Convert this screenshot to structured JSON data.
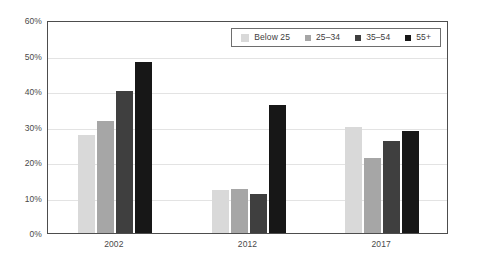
{
  "chart_data": {
    "type": "bar",
    "title": "",
    "subtitle": "",
    "xlabel": "",
    "ylabel": "",
    "categories": [
      "2002",
      "2012",
      "2017"
    ],
    "series": [
      {
        "name": "Below 25",
        "values": [
          27.5,
          12.0,
          30.0
        ],
        "color": "#d9d9d9"
      },
      {
        "name": "25–34",
        "values": [
          31.5,
          12.3,
          21.0
        ],
        "color": "#a6a6a6"
      },
      {
        "name": "35–54",
        "values": [
          40.0,
          11.0,
          26.0
        ],
        "color": "#3f3f3f"
      },
      {
        "name": "55+",
        "values": [
          48.2,
          36.2,
          28.7
        ],
        "color": "#171717"
      }
    ],
    "ylim": [
      0,
      60
    ],
    "ytick_values": [
      0,
      10,
      20,
      30,
      40,
      50,
      60
    ],
    "ytick_labels": [
      "0%",
      "10%",
      "20%",
      "30%",
      "40%",
      "50%",
      "60%"
    ],
    "xtick_labels": [
      "2002",
      "2012",
      "2017"
    ],
    "grid": true,
    "grid_axis": "y",
    "legend": true,
    "legend_position": "top-right",
    "value_suffix": "%"
  },
  "legend": {
    "items": [
      {
        "label": "Below 25",
        "color": "#d9d9d9"
      },
      {
        "label": "25–34",
        "color": "#a6a6a6"
      },
      {
        "label": "35–54",
        "color": "#3f3f3f"
      },
      {
        "label": "55+",
        "color": "#171717"
      }
    ]
  },
  "axes": {
    "y_labels": [
      "60%",
      "50%",
      "40%",
      "30%",
      "20%",
      "10%",
      "0%"
    ],
    "x_labels": [
      "2002",
      "2012",
      "2017"
    ]
  },
  "colors": {
    "plot_border": "#4d4d4d",
    "gridline": "#e3e3e3",
    "axis_text": "#4a4a4a",
    "legend_border": "#6e6e6e",
    "background": "#ffffff"
  }
}
